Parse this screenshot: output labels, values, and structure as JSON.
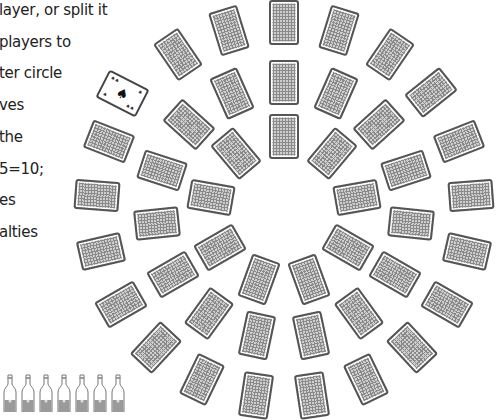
{
  "rules_text": {
    "lines": [
      "layer, or split it",
      "players to",
      "ter circle",
      "ves",
      "the",
      "5=10;",
      "es",
      "alties"
    ]
  },
  "board": {
    "center": [
      284,
      210
    ],
    "ace_card": {
      "rank": "A",
      "suit": "spade-icon",
      "suit_glyph": "♠"
    },
    "rings": [
      {
        "name": "inner",
        "radius": 74,
        "count": 9
      },
      {
        "name": "middle",
        "radius": 128,
        "count": 15
      },
      {
        "name": "outer",
        "radius": 188,
        "count": 21
      }
    ]
  },
  "drinks": {
    "bottle_count": 7
  },
  "colors": {
    "card_border": "#555555",
    "card_fill": "#cfcfcf",
    "grid_line": "#8a8a8a",
    "text": "#222222"
  }
}
